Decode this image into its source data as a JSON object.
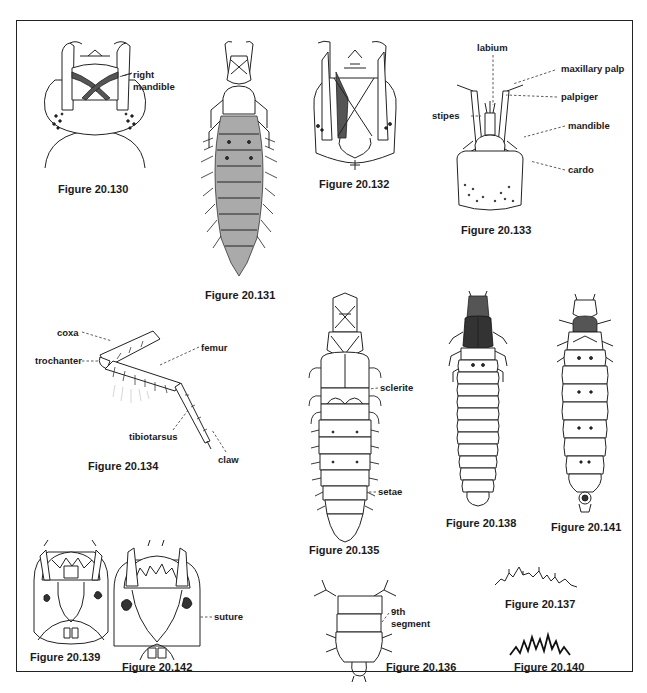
{
  "plate": {
    "figures": [
      {
        "id": "20.130",
        "caption": "Figure 20.130",
        "labels": [
          "right mandible"
        ]
      },
      {
        "id": "20.131",
        "caption": "Figure 20.131",
        "labels": []
      },
      {
        "id": "20.132",
        "caption": "Figure 20.132",
        "labels": []
      },
      {
        "id": "20.133",
        "caption": "Figure 20.133",
        "labels": [
          "labium",
          "maxillary palp",
          "palpiger",
          "stipes",
          "mandible",
          "cardo"
        ]
      },
      {
        "id": "20.134",
        "caption": "Figure 20.134",
        "labels": [
          "coxa",
          "trochanter",
          "femur",
          "tibiotarsus",
          "claw"
        ]
      },
      {
        "id": "20.135",
        "caption": "Figure 20.135",
        "labels": [
          "sclerite",
          "setae"
        ]
      },
      {
        "id": "20.136",
        "caption": "Figure 20.136",
        "labels": [
          "9th segment"
        ]
      },
      {
        "id": "20.137",
        "caption": "Figure 20.137",
        "labels": []
      },
      {
        "id": "20.138",
        "caption": "Figure 20.138",
        "labels": []
      },
      {
        "id": "20.139",
        "caption": "Figure 20.139",
        "labels": []
      },
      {
        "id": "20.140",
        "caption": "Figure 20.140",
        "labels": []
      },
      {
        "id": "20.141",
        "caption": "Figure 20.141",
        "labels": []
      },
      {
        "id": "20.142",
        "caption": "Figure 20.142",
        "labels": [
          "suture"
        ]
      }
    ]
  },
  "captions": {
    "f130": "Figure 20.130",
    "f131": "Figure 20.131",
    "f132": "Figure 20.132",
    "f133": "Figure 20.133",
    "f134": "Figure 20.134",
    "f135": "Figure 20.135",
    "f136": "Figure 20.136",
    "f137": "Figure 20.137",
    "f138": "Figure 20.138",
    "f139": "Figure 20.139",
    "f140": "Figure 20.140",
    "f141": "Figure 20.141",
    "f142": "Figure 20.142"
  },
  "labels": {
    "right": "right",
    "mandible_130": "mandible",
    "labium": "labium",
    "maxillary_palp": "maxillary palp",
    "palpiger": "palpiger",
    "stipes": "stipes",
    "mandible": "mandible",
    "cardo": "cardo",
    "coxa": "coxa",
    "trochanter": "trochanter",
    "femur": "femur",
    "tibiotarsus": "tibiotarsus",
    "claw": "claw",
    "sclerite": "sclerite",
    "setae": "setae",
    "ninth": "9th",
    "segment": "segment",
    "suture": "suture"
  }
}
